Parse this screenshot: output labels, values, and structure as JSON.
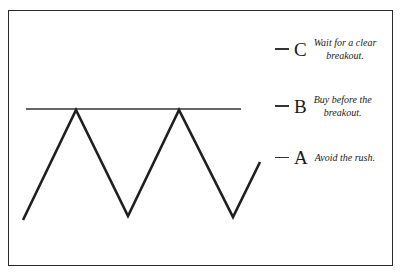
{
  "diagram": {
    "type": "double-top chart pattern",
    "resistance_line": true,
    "labels": [
      {
        "letter": "C",
        "note_lines": [
          "Wait for a clear",
          "breakout."
        ]
      },
      {
        "letter": "B",
        "note_lines": [
          "Buy before the",
          "breakout."
        ]
      },
      {
        "letter": "A",
        "note_lines": [
          "Avoid the rush."
        ]
      }
    ],
    "colors": {
      "line": "#1f1f1f",
      "frame": "#2a2a2a",
      "background": "#ffffff"
    }
  }
}
